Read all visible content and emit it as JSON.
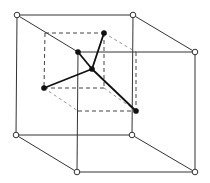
{
  "diagram": {
    "title": "",
    "colors": {
      "background": "#ffffff",
      "outer_edges": "#333333",
      "inner_edges": "#444444",
      "bonds": "#111111",
      "corner_atom_fill": "#ffffff",
      "bonded_atom_fill": "#111111"
    },
    "outer_cube": {
      "edge_style": "solid",
      "corner_atoms": [
        {
          "id": "back-top-left",
          "style": "open-circle"
        },
        {
          "id": "back-top-right",
          "style": "open-circle"
        },
        {
          "id": "front-top-right",
          "style": "open-circle"
        },
        {
          "id": "back-bottom-left",
          "style": "open-circle"
        },
        {
          "id": "back-bottom-right",
          "style": "open-circle"
        },
        {
          "id": "front-bottom-left",
          "style": "open-circle"
        },
        {
          "id": "front-bottom-right",
          "style": "open-circle"
        }
      ]
    },
    "inner_cube": {
      "edge_style": "dashed"
    },
    "atoms": [
      {
        "id": "center",
        "style": "filled",
        "role": "central atom"
      },
      {
        "id": "neighbor-top",
        "style": "filled",
        "role": "bonded neighbour"
      },
      {
        "id": "neighbor-upper-left",
        "style": "filled",
        "role": "bonded neighbour"
      },
      {
        "id": "neighbor-left",
        "style": "filled",
        "role": "bonded neighbour"
      },
      {
        "id": "neighbor-lower-right",
        "style": "filled",
        "role": "bonded neighbour"
      }
    ],
    "bonds": [
      {
        "from": "center",
        "to": "neighbor-top"
      },
      {
        "from": "center",
        "to": "neighbor-upper-left"
      },
      {
        "from": "center",
        "to": "neighbor-left"
      },
      {
        "from": "center",
        "to": "neighbor-lower-right"
      }
    ]
  }
}
